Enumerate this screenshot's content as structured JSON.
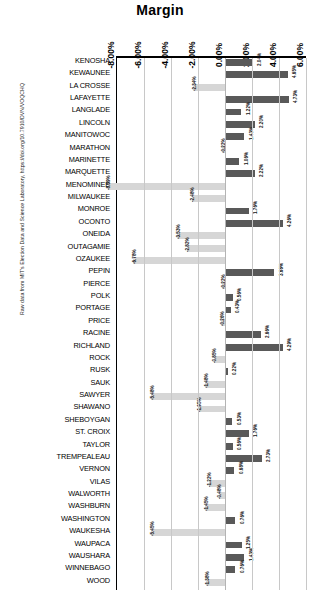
{
  "chart_data": {
    "type": "bar",
    "orientation": "horizontal",
    "title": "Margin",
    "xlabel": "",
    "ylabel": "",
    "xlim": [
      -8.0,
      6.0
    ],
    "xtick_labels": [
      "-8.00%",
      "-6.00%",
      "-4.00%",
      "-2.00%",
      "0.00%",
      "2.00%",
      "4.00%",
      "6.00%"
    ],
    "xticks": [
      -8.0,
      -6.0,
      -4.0,
      -2.0,
      0.0,
      2.0,
      4.0,
      6.0
    ],
    "grid": true,
    "legend": "none",
    "colors": {
      "positive": "#595959",
      "negative": "#d6d6d6"
    },
    "categories": [
      "KENOSHA",
      "KEWAUNEE",
      "LA CROSSE",
      "LAFAYETTE",
      "LANGLADE",
      "LINCOLN",
      "MANITOWOC",
      "MARATHON",
      "MARINETTE",
      "MARQUETTE",
      "MENOMINEE",
      "MILWAUKEE",
      "MONROE",
      "OCONTO",
      "ONEIDA",
      "OUTAGAMIE",
      "OZAUKEE",
      "PEPIN",
      "PIERCE",
      "POLK",
      "PORTAGE",
      "PRICE",
      "RACINE",
      "RICHLAND",
      "ROCK",
      "RUSK",
      "SAUK",
      "SAWYER",
      "SHAWANO",
      "SHEBOYGAN",
      "ST. CROIX",
      "TAYLOR",
      "TREMPEALEAU",
      "VERNON",
      "VILAS",
      "WALWORTH",
      "WASHBURN",
      "WASHINGTON",
      "WAUKESHA",
      "WAUPACA",
      "WAUSHARA",
      "WINNEBAGO",
      "WOOD"
    ],
    "values": [
      2.04,
      4.65,
      -2.34,
      4.73,
      1.22,
      2.2,
      1.43,
      -0.22,
      1.06,
      2.22,
      -8.69,
      -2.48,
      1.76,
      4.26,
      -3.53,
      -2.82,
      -6.78,
      3.66,
      -0.22,
      0.56,
      0.43,
      -0.26,
      2.66,
      4.29,
      -0.85,
      0.22,
      -1.48,
      -5.48,
      -1.95,
      0.53,
      1.76,
      0.56,
      2.73,
      0.68,
      -1.22,
      -0.48,
      -1.45,
      0.76,
      -5.45,
      1.25,
      1.43,
      0.76,
      -1.38
    ],
    "value_labels": [
      "2.04%",
      "4.65%",
      "-2.34%",
      "4.73%",
      "1.22%",
      "2.20%",
      "1.43%",
      "-0.22%",
      "1.06%",
      "2.22%",
      "-8.69%",
      "-2.48%",
      "1.76%",
      "4.26%",
      "-3.53%",
      "-2.82%",
      "-6.78%",
      "3.66%",
      "-0.22%",
      "0.56%",
      "0.43%",
      "-0.26%",
      "2.66%",
      "4.29%",
      "-0.85%",
      "0.22%",
      "-1.48%",
      "-5.48%",
      "-1.95%",
      "0.53%",
      "1.76%",
      "0.56%",
      "2.73%",
      "0.68%",
      "-1.22%",
      "-0.48%",
      "-1.45%",
      "0.76%",
      "-5.45%",
      "1.25%",
      "1.43%",
      "0.76%",
      "-1.38%"
    ]
  },
  "source_note": "Raw data from MIT's Election Data and Science Laboratory, https://doi.org/10.7910/DVN/VOQCHQ"
}
